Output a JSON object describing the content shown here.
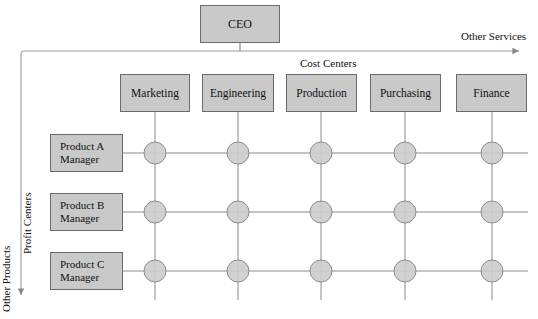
{
  "diagram": {
    "title_node": {
      "label": "CEO"
    },
    "axes": {
      "horizontal_label": "Other Services",
      "vertical_label": "Other Products",
      "vertical_inner_label": "Profit Centers",
      "columns_header": "Cost Centers"
    },
    "cost_centers": [
      {
        "label": "Marketing"
      },
      {
        "label": "Engineering"
      },
      {
        "label": "Production"
      },
      {
        "label": "Purchasing"
      },
      {
        "label": "Finance"
      }
    ],
    "profit_centers": [
      {
        "line1": "Product A",
        "line2": "Manager"
      },
      {
        "line1": "Product  B",
        "line2": "Manager"
      },
      {
        "line1": "Product C",
        "line2": "Manager"
      }
    ],
    "colors": {
      "box_fill": "#c9c9c9",
      "box_border": "#6b6b6b",
      "node_fill": "#cccccc",
      "node_border": "#8c8c8c",
      "line": "#8a8a8a",
      "rail": "#9a9a9a",
      "text": "#111111",
      "background": "#ffffff"
    },
    "grid": {
      "column_x": [
        155,
        238,
        321,
        405,
        492
      ],
      "row_y": [
        153,
        212,
        271
      ],
      "node_radius": 11
    }
  }
}
